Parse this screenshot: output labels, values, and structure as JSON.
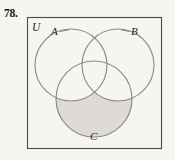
{
  "exercise": {
    "number": "78."
  },
  "figure": {
    "type": "venn-diagram-3-set",
    "universe_label": "U",
    "set_labels": {
      "a": "A",
      "b": "B",
      "c": "C"
    },
    "shaded_description": "C only (inside C, outside A and B)",
    "colors": {
      "background": "#f7f5f2",
      "frame_stroke": "#4a4a4a",
      "circle_stroke": "#8a8a8a",
      "shade_fill": "#dedad5",
      "label_text": "#1f1f1f",
      "number_text": "#1a1a1a"
    },
    "geometry": {
      "frame": {
        "x": 27,
        "y": 17,
        "width": 135,
        "height": 132
      },
      "circle_a": {
        "cx": 71,
        "cy": 65,
        "r": 36
      },
      "circle_b": {
        "cx": 118,
        "cy": 65,
        "r": 36
      },
      "circle_c": {
        "cx": 94,
        "cy": 99,
        "r": 38
      }
    }
  }
}
